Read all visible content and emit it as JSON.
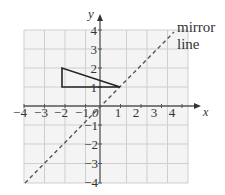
{
  "diagram": {
    "axes": {
      "x_label": "x",
      "y_label": "y",
      "x_ticks": [
        "−4",
        "−3",
        "−2",
        "−1",
        "1",
        "2",
        "3",
        "4"
      ],
      "y_ticks": [
        "4",
        "3",
        "2",
        "1",
        "−1",
        "−2",
        "−3",
        "−4"
      ],
      "origin_label": "0",
      "range": {
        "x": [
          -4,
          4
        ],
        "y": [
          -4,
          4
        ]
      }
    },
    "shape": {
      "type": "triangle",
      "vertices": [
        [
          -2,
          1
        ],
        [
          -2,
          2
        ],
        [
          1,
          1
        ]
      ],
      "color": "#222222"
    },
    "mirror_line": {
      "equation": "y = x",
      "label_line1": "mirror",
      "label_line2": "line",
      "style": "dashed"
    },
    "colors": {
      "grid_fill": "#f4f4f4",
      "grid_line": "#cccccc",
      "axis": "#555555"
    }
  }
}
